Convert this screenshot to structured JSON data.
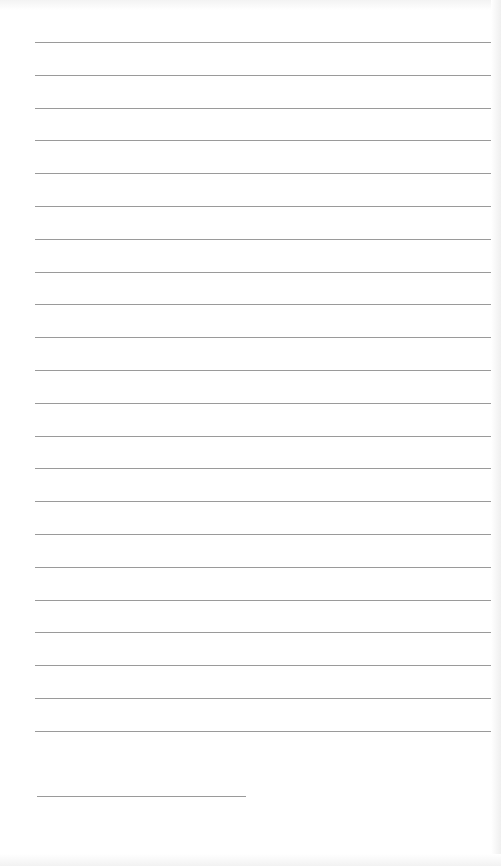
{
  "paper": {
    "background_color": "#ffffff",
    "rule_color": "#9a9a9a",
    "rules": {
      "count": 22,
      "first_y": 42,
      "spacing": 32.8,
      "x_start": 35,
      "x_end": 491
    },
    "signature_line": {
      "y": 796,
      "x_start": 37,
      "x_end": 246
    }
  }
}
